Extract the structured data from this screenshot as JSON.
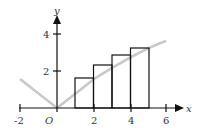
{
  "diagram": {
    "x_axis_label": "x",
    "y_axis_label": "y",
    "origin_label": "O",
    "x_ticks": [
      {
        "value": -2,
        "label": "-2"
      },
      {
        "value": 2,
        "label": "2"
      },
      {
        "value": 4,
        "label": "4"
      },
      {
        "value": 6,
        "label": "6"
      }
    ],
    "y_ticks": [
      {
        "value": 2,
        "label": "2"
      },
      {
        "value": 4,
        "label": "4"
      }
    ],
    "curve_color": "#c8c8c8",
    "rectangles": [
      {
        "x0": 1,
        "x1": 2,
        "height": 1.6
      },
      {
        "x0": 2,
        "x1": 3,
        "height": 2.3
      },
      {
        "x0": 3,
        "x1": 4,
        "height": 2.8
      },
      {
        "x0": 4,
        "x1": 5,
        "height": 3.2
      }
    ]
  }
}
